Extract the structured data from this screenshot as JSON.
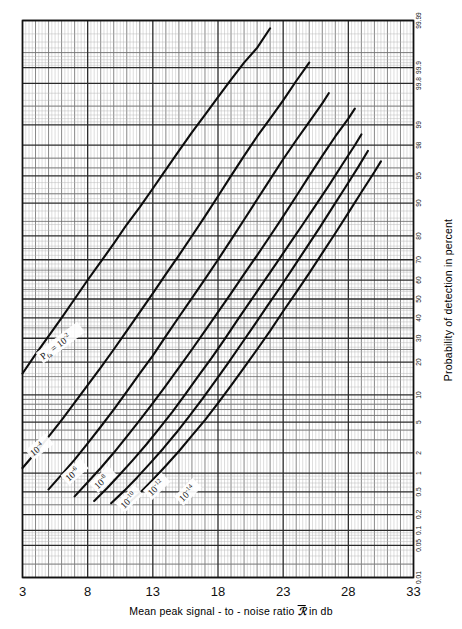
{
  "chart_data": {
    "type": "line",
    "title": "",
    "xlabel": "Mean peak signal - to - noise ratio ℛ̅ in db",
    "ylabel": "Probability of detection in percent",
    "x_axis": {
      "type": "linear",
      "min": 3,
      "max": 33,
      "tick_labels": [
        "3",
        "8",
        "13",
        "18",
        "23",
        "28",
        "33"
      ],
      "tick_values": [
        3,
        8,
        13,
        18,
        23,
        28,
        33
      ],
      "minor_step": 1
    },
    "y_axis": {
      "type": "normal-probability",
      "position": "right",
      "units": "percent",
      "min": 0.01,
      "max": 99.99,
      "tick_labels": [
        "99.99",
        "99.9",
        "99.8",
        "99",
        "98",
        "95",
        "90",
        "80",
        "70",
        "60",
        "50",
        "40",
        "30",
        "20",
        "10",
        "5",
        "2",
        "1",
        "0.5",
        "0.2",
        "0.1",
        "0.05",
        "0.01"
      ],
      "tick_values": [
        99.99,
        99.9,
        99.8,
        99,
        98,
        95,
        90,
        80,
        70,
        60,
        50,
        40,
        30,
        20,
        10,
        5,
        2,
        1,
        0.5,
        0.2,
        0.1,
        0.05,
        0.01
      ]
    },
    "grid": "on",
    "legend": "inline-curve-labels",
    "series": [
      {
        "name": "Pfa = 10-2",
        "label": "Pₑₐ = 10⁻²",
        "label_main": "P",
        "label_sub": "fa",
        "label_eq": "= 10",
        "label_exp": "-2",
        "points": [
          [
            3.0,
            16.0
          ],
          [
            4.0,
            23.0
          ],
          [
            5.0,
            31.0
          ],
          [
            6.0,
            40.0
          ],
          [
            7.0,
            50.0
          ],
          [
            8.0,
            60.0
          ],
          [
            9.0,
            69.0
          ],
          [
            10.0,
            77.0
          ],
          [
            11.0,
            84.0
          ],
          [
            12.0,
            89.0
          ],
          [
            13.0,
            93.0
          ],
          [
            14.0,
            95.8
          ],
          [
            15.0,
            97.6
          ],
          [
            16.0,
            98.7
          ],
          [
            17.0,
            99.3
          ],
          [
            18.0,
            99.65
          ],
          [
            19.0,
            99.83
          ],
          [
            20.0,
            99.92
          ],
          [
            21.0,
            99.96
          ],
          [
            22.0,
            99.985
          ]
        ]
      },
      {
        "name": "10-4",
        "label": "10⁻⁴",
        "label_exp": "-4",
        "points": [
          [
            3.0,
            1.2
          ],
          [
            4.0,
            2.0
          ],
          [
            5.0,
            3.3
          ],
          [
            6.0,
            5.3
          ],
          [
            7.0,
            8.3
          ],
          [
            8.0,
            12.5
          ],
          [
            9.0,
            18.0
          ],
          [
            10.0,
            25.0
          ],
          [
            11.0,
            33.5
          ],
          [
            12.0,
            43.0
          ],
          [
            13.0,
            53.0
          ],
          [
            14.0,
            63.0
          ],
          [
            15.0,
            72.0
          ],
          [
            16.0,
            80.0
          ],
          [
            17.0,
            86.5
          ],
          [
            18.0,
            91.5
          ],
          [
            19.0,
            95.0
          ],
          [
            20.0,
            97.2
          ],
          [
            21.0,
            98.5
          ],
          [
            22.0,
            99.2
          ],
          [
            23.0,
            99.6
          ],
          [
            24.0,
            99.82
          ],
          [
            25.0,
            99.92
          ]
        ]
      },
      {
        "name": "10-6",
        "label": "10⁻⁶",
        "label_exp": "-6",
        "points": [
          [
            5.0,
            0.55
          ],
          [
            6.0,
            0.95
          ],
          [
            7.0,
            1.6
          ],
          [
            8.0,
            2.7
          ],
          [
            9.0,
            4.4
          ],
          [
            10.0,
            7.0
          ],
          [
            11.0,
            10.8
          ],
          [
            12.0,
            16.0
          ],
          [
            13.0,
            22.5
          ],
          [
            14.0,
            31.0
          ],
          [
            15.0,
            40.5
          ],
          [
            16.0,
            50.5
          ],
          [
            17.0,
            60.5
          ],
          [
            18.0,
            70.0
          ],
          [
            19.0,
            78.5
          ],
          [
            20.0,
            85.5
          ],
          [
            21.0,
            90.8
          ],
          [
            22.0,
            94.5
          ],
          [
            23.0,
            96.9
          ],
          [
            24.0,
            98.3
          ],
          [
            25.0,
            99.1
          ],
          [
            26.0,
            99.55
          ],
          [
            26.5,
            99.7
          ]
        ]
      },
      {
        "name": "10-8",
        "label": "10⁻⁸",
        "label_exp": "-8",
        "points": [
          [
            7.0,
            0.42
          ],
          [
            8.0,
            0.72
          ],
          [
            9.0,
            1.2
          ],
          [
            10.0,
            2.0
          ],
          [
            11.0,
            3.3
          ],
          [
            12.0,
            5.3
          ],
          [
            13.0,
            8.2
          ],
          [
            14.0,
            12.4
          ],
          [
            15.0,
            18.0
          ],
          [
            16.0,
            25.0
          ],
          [
            17.0,
            33.5
          ],
          [
            18.0,
            43.0
          ],
          [
            19.0,
            53.0
          ],
          [
            20.0,
            63.0
          ],
          [
            21.0,
            72.0
          ],
          [
            22.0,
            80.0
          ],
          [
            23.0,
            86.5
          ],
          [
            24.0,
            91.5
          ],
          [
            25.0,
            95.0
          ],
          [
            26.0,
            97.2
          ],
          [
            27.0,
            98.5
          ],
          [
            28.0,
            99.2
          ],
          [
            28.5,
            99.45
          ]
        ]
      },
      {
        "name": "10-10",
        "label": "10⁻¹⁰",
        "label_exp": "-10",
        "points": [
          [
            8.5,
            0.35
          ],
          [
            9.5,
            0.58
          ],
          [
            10.5,
            0.97
          ],
          [
            11.5,
            1.6
          ],
          [
            12.5,
            2.6
          ],
          [
            13.5,
            4.2
          ],
          [
            14.5,
            6.6
          ],
          [
            15.5,
            10.2
          ],
          [
            16.5,
            15.2
          ],
          [
            17.5,
            21.5
          ],
          [
            18.5,
            29.5
          ],
          [
            19.5,
            39.0
          ],
          [
            20.5,
            49.0
          ],
          [
            21.5,
            59.0
          ],
          [
            22.5,
            68.5
          ],
          [
            23.5,
            77.0
          ],
          [
            24.5,
            84.0
          ],
          [
            25.5,
            89.5
          ],
          [
            26.5,
            93.5
          ],
          [
            27.5,
            96.3
          ],
          [
            28.5,
            98.0
          ],
          [
            29.0,
            98.6
          ]
        ]
      },
      {
        "name": "10-12",
        "label": "10⁻¹²",
        "label_exp": "-12",
        "points": [
          [
            9.8,
            0.32
          ],
          [
            10.8,
            0.52
          ],
          [
            11.8,
            0.86
          ],
          [
            12.8,
            1.42
          ],
          [
            13.8,
            2.3
          ],
          [
            14.8,
            3.7
          ],
          [
            15.8,
            5.9
          ],
          [
            16.8,
            9.1
          ],
          [
            17.8,
            13.7
          ],
          [
            18.8,
            19.8
          ],
          [
            19.8,
            27.5
          ],
          [
            20.8,
            36.5
          ],
          [
            21.8,
            46.5
          ],
          [
            22.8,
            56.5
          ],
          [
            23.8,
            66.5
          ],
          [
            24.8,
            75.5
          ],
          [
            25.8,
            83.0
          ],
          [
            26.8,
            89.0
          ],
          [
            27.8,
            93.3
          ],
          [
            28.8,
            96.2
          ],
          [
            29.5,
            97.6
          ]
        ]
      },
      {
        "name": "10-14",
        "label": "10⁻¹⁴",
        "label_exp": "-14",
        "points": [
          [
            11.0,
            0.3
          ],
          [
            12.0,
            0.48
          ],
          [
            13.0,
            0.79
          ],
          [
            14.0,
            1.3
          ],
          [
            15.0,
            2.1
          ],
          [
            16.0,
            3.4
          ],
          [
            17.0,
            5.3
          ],
          [
            18.0,
            8.2
          ],
          [
            19.0,
            12.4
          ],
          [
            20.0,
            18.0
          ],
          [
            21.0,
            25.0
          ],
          [
            22.0,
            33.5
          ],
          [
            23.0,
            43.5
          ],
          [
            24.0,
            53.5
          ],
          [
            25.0,
            63.5
          ],
          [
            26.0,
            73.0
          ],
          [
            27.0,
            81.0
          ],
          [
            28.0,
            87.5
          ],
          [
            29.0,
            92.3
          ],
          [
            30.0,
            95.5
          ],
          [
            30.5,
            96.7
          ]
        ]
      }
    ]
  },
  "figure": {
    "xlabel_parts": {
      "pre": "Mean peak signal - to - noise ratio ",
      "symbol": "ℛ",
      "post": " in db"
    },
    "ylabel": "Probability of detection in percent"
  }
}
